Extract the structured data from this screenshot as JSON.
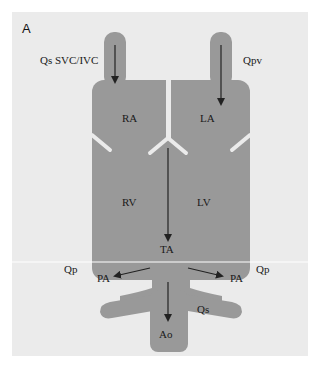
{
  "figure": {
    "panel_label": "A",
    "colors": {
      "background": "#ebebeb",
      "chambers": "#999999",
      "septum": "#ebebeb",
      "arrow": "#222222",
      "text": "#1a1a1a"
    }
  },
  "labels": {
    "svc_ivc": "Qs SVC/IVC",
    "qpv": "Qpv",
    "ra": "RA",
    "la": "LA",
    "rv": "RV",
    "lv": "LV",
    "ta": "TA",
    "qp_left": "Qp",
    "qp_right": "Qp",
    "pa_left": "PA",
    "pa_right": "PA",
    "qs": "Qs",
    "ao": "Ao"
  }
}
